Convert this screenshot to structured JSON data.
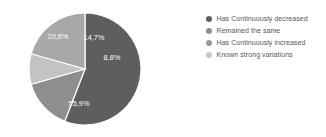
{
  "chart_data": {
    "type": "pie",
    "title": "",
    "legend_position": "right",
    "grid": false,
    "start_angle_deg": 90,
    "direction": "clockwise",
    "separator_color": "#ffffff",
    "label_text_color": "#ffffff",
    "background": "#ffffff",
    "categories": [
      "Has Continuously decreased",
      "Remained the same",
      "Has Continuously increased",
      "Known strong variations"
    ],
    "values": [
      55.9,
      14.7,
      8.8,
      20.6
    ],
    "labels": [
      "55,9%",
      "14,7%",
      "8,8%",
      "20,6%"
    ],
    "colors": [
      "#5e5e5e",
      "#8e8e8e",
      "#c3c3c3",
      "#a8a8a8"
    ],
    "slices": [
      {
        "name": "Has Continuously decreased",
        "value": 55.9,
        "label": "55,9%",
        "color": "#5e5e5e",
        "legend_color": "#5e5e5e",
        "label_x": 79,
        "label_y": 104
      },
      {
        "name": "Remained the same",
        "value": 14.7,
        "label": "14,7%",
        "color": "#8e8e8e",
        "legend_color": "#8e8e8e",
        "label_x": 94,
        "label_y": 38
      },
      {
        "name": "Has Continuously increased",
        "value": 8.8,
        "label": "8,8%",
        "color": "#c3c3c3",
        "legend_color": "#b5b5b5",
        "label_x": 112,
        "label_y": 58
      },
      {
        "name": "Known strong variations",
        "value": 20.6,
        "label": "20,6%",
        "color": "#a8a8a8",
        "legend_color": "#c8c8c8",
        "label_x": 58,
        "label_y": 37
      }
    ],
    "geometry": {
      "center_x": 85,
      "center_y": 69,
      "radius": 56
    }
  },
  "legend": {
    "items": [
      {
        "label": "Has Continuously decreased",
        "color": "#5e5e5e"
      },
      {
        "label": "Remained the same",
        "color": "#8e8e8e"
      },
      {
        "label": "Has Continuously increased",
        "color": "#9a9a9a"
      },
      {
        "label": "Known strong variations",
        "color": "#c8c8c8"
      }
    ]
  }
}
